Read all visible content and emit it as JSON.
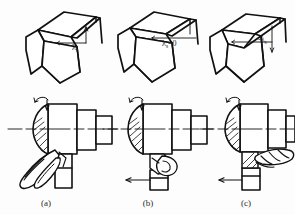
{
  "figure": {
    "background_color": "#fdfdfd",
    "line_color": "#111111",
    "text_color": "#1a1a1a"
  },
  "panels": [
    {
      "id": "a",
      "caption": "(a)",
      "angle_label": "λ",
      "angle_subscript": "s",
      "angle_sign": "",
      "angle_value": "",
      "full_label": "λs",
      "description": "positive inclination angle, chip flows toward machined surface (downward-left)",
      "chip_direction": "down-left",
      "has_feed_arrow": false,
      "has_rotation_arrow": true
    },
    {
      "id": "b",
      "caption": "(b)",
      "angle_label": "λ",
      "angle_subscript": "s",
      "angle_sign": "",
      "angle_value": "=0",
      "full_label": "λs=0",
      "description": "zero inclination angle, chip flows perpendicular, curls at tool tip",
      "chip_direction": "curl",
      "has_feed_arrow": true,
      "has_rotation_arrow": true
    },
    {
      "id": "c",
      "caption": "(c)",
      "angle_label": "λ",
      "angle_subscript": "s",
      "angle_sign": "-",
      "angle_value": "",
      "full_label": "-λs",
      "description": "negative inclination angle, chip flows toward work surface (right helix)",
      "chip_direction": "right",
      "has_feed_arrow": true,
      "has_rotation_arrow": true
    }
  ],
  "icons": {
    "rotation_arrow": "rotation-arrow-icon",
    "feed_arrow": "feed-arrow-icon",
    "angle_arrow": "angle-indicator-arrow-icon",
    "centerline": "centerline-icon"
  }
}
